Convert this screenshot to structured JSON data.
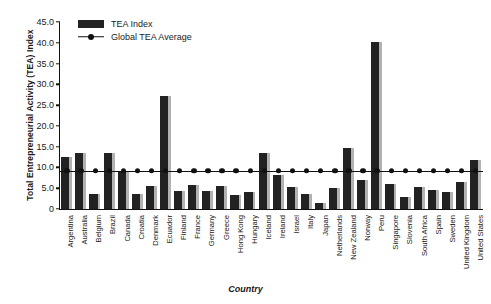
{
  "chart_data": {
    "type": "bar",
    "title": "",
    "xlabel": "Country",
    "ylabel": "Total Entrepreneurial Activity (TEA) Index",
    "ylim": [
      0,
      45
    ],
    "ytick_labels": [
      "45.0",
      "40.0",
      "35.0",
      "30.0",
      "25.0",
      "20.0",
      "15.0",
      "10.0",
      "5.0",
      "0"
    ],
    "ytick_values": [
      45,
      40,
      35,
      30,
      25,
      20,
      15,
      10,
      5,
      0
    ],
    "grid": false,
    "legend_position": "top-left",
    "legend": [
      "TEA Index",
      "Global TEA Average"
    ],
    "global_average": 9.2,
    "categories": [
      "Argentina",
      "Australia",
      "Belgium",
      "Brazil",
      "Canada",
      "Croatia",
      "Denmark",
      "Ecuador",
      "Finland",
      "France",
      "Germany",
      "Greece",
      "Hong Kong",
      "Hungary",
      "Iceland",
      "Ireland",
      "Israel",
      "Italy",
      "Japan",
      "Netherlands",
      "New Zealand",
      "Norway",
      "Peru",
      "Singapore",
      "Slovenia",
      "South Africa",
      "Spain",
      "Sweden",
      "United Kingdom",
      "United States"
    ],
    "series": [
      {
        "name": "TEA Index",
        "values": [
          12.5,
          13.4,
          3.5,
          13.5,
          8.8,
          3.6,
          5.6,
          27.2,
          4.4,
          5.7,
          4.3,
          5.5,
          3.3,
          4.1,
          13.6,
          8.1,
          5.4,
          3.5,
          1.5,
          5.1,
          14.7,
          7.0,
          40.2,
          5.9,
          2.9,
          5.4,
          4.5,
          4.0,
          6.6,
          11.7
        ]
      }
    ],
    "average_line_values": [
      9.2,
      9.2,
      9.2,
      9.2,
      9.2,
      9.2,
      9.2,
      9.2,
      9.2,
      9.2,
      9.2,
      9.2,
      9.2,
      9.2,
      9.2,
      9.2,
      9.2,
      9.2,
      9.2,
      9.2,
      9.2,
      9.2,
      9.2,
      9.2,
      9.2,
      9.2,
      9.2,
      9.2,
      9.2,
      9.2
    ],
    "colors": {
      "bar": "#222222",
      "bar_shadow": "#b2b2b2",
      "line": "#111111",
      "background": "#ffffff",
      "axis": "#111111"
    }
  },
  "axis": {
    "y_title": "Total Entrepreneurial Activity (TEA) Index",
    "x_title": "Country"
  },
  "legend": {
    "items": [
      {
        "label": "TEA Index",
        "marker": "bar-swatch"
      },
      {
        "label": "Global TEA Average",
        "marker": "line-dot-marker"
      }
    ]
  }
}
